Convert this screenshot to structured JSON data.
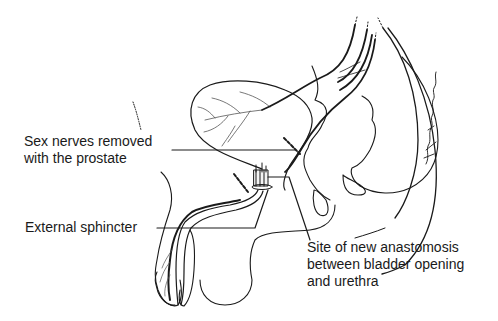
{
  "diagram": {
    "type": "anatomical-illustration",
    "style": "black line drawing on white",
    "colors": {
      "line": "#1a1a1a",
      "background": "#ffffff"
    }
  },
  "labels": {
    "nerves": {
      "line1": "Sex nerves removed",
      "line2": "with the prostate"
    },
    "sphincter": {
      "line1": "External sphincter"
    },
    "site": {
      "line1": "Site of new anastomosis",
      "line2": "between bladder opening",
      "line3": "and urethra"
    }
  },
  "signature": {
    "present": true
  }
}
